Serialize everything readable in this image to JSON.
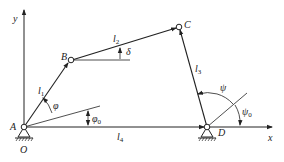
{
  "diagram": {
    "type": "four-bar linkage",
    "colors": {
      "line": "#222222",
      "background": "#ffffff"
    },
    "axes": {
      "x_label": "x",
      "y_label": "y"
    },
    "joints": {
      "A": {
        "label": "A"
      },
      "B": {
        "label": "B"
      },
      "C": {
        "label": "C"
      },
      "D": {
        "label": "D"
      },
      "O": {
        "label": "O"
      }
    },
    "links": {
      "l1": {
        "base": "l",
        "sub": "1"
      },
      "l2": {
        "base": "l",
        "sub": "2"
      },
      "l3": {
        "base": "l",
        "sub": "3"
      },
      "l4": {
        "base": "l",
        "sub": "4"
      }
    },
    "angles": {
      "phi": {
        "base": "φ",
        "sub": ""
      },
      "phi0": {
        "base": "φ",
        "sub": "0"
      },
      "psi": {
        "base": "ψ",
        "sub": ""
      },
      "psi0": {
        "base": "ψ",
        "sub": "0"
      },
      "delta": {
        "base": "δ",
        "sub": ""
      }
    }
  }
}
